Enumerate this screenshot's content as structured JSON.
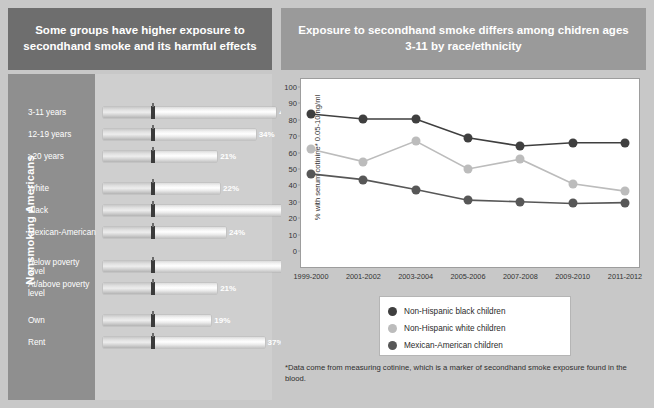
{
  "headers": {
    "left": "Some groups have higher exposure to secondhand smoke and its harmful effects",
    "right": "Exposure to secondhand smoke differs among chidren ages 3-11 by race/ethnicity"
  },
  "left_chart": {
    "axis_title": "Nonsmoking Americans",
    "type": "bar",
    "unit": "%",
    "max": 50,
    "items": [
      {
        "label": "3-11 years",
        "value": 41,
        "value_label": "41%"
      },
      {
        "label": "12-19 years",
        "value": 34,
        "value_label": "34%"
      },
      {
        "label": "≥20 years",
        "value": 21,
        "value_label": "21%"
      },
      {
        "label": "White",
        "value": 22,
        "value_label": "22%"
      },
      {
        "label": "Black",
        "value": 47,
        "value_label": "47%"
      },
      {
        "label": "Mexican-American",
        "value": 24,
        "value_label": "24%"
      },
      {
        "label": "Below poverty level",
        "value": 43,
        "value_label": "43%"
      },
      {
        "label": "At/above poverty level",
        "value": 21,
        "value_label": "21%"
      },
      {
        "label": "Own",
        "value": 19,
        "value_label": "19%"
      },
      {
        "label": "Rent",
        "value": 37,
        "value_label": "37%"
      }
    ]
  },
  "chart_data": {
    "type": "line",
    "title": "Exposure to secondhand smoke differs among chidren ages 3-11 by race/ethnicity",
    "xlabel": "",
    "ylabel": "% with serum cotinine* 0.05-10 ng/ml",
    "ylim": [
      0,
      100
    ],
    "ytick_step": 10,
    "yticks": [
      0,
      10,
      20,
      30,
      40,
      50,
      60,
      70,
      80,
      90,
      100
    ],
    "grid": false,
    "legend_position": "below-plot",
    "categories": [
      "1999-2000",
      "2001-2002",
      "2003-2004",
      "2005-2006",
      "2007-2008",
      "2009-2010",
      "2011-2012"
    ],
    "series": [
      {
        "name": "Non-Hispanic black children",
        "color": "#3f3f3f",
        "values": [
          83.5,
          80.5,
          80.5,
          69,
          64,
          66,
          66
        ]
      },
      {
        "name": "Non-Hispanic white children",
        "color": "#bcbcbc",
        "values": [
          62,
          54.5,
          67,
          50,
          56,
          41,
          36.5
        ]
      },
      {
        "name": "Mexican-American children",
        "color": "#575757",
        "values": [
          47,
          43.5,
          37.5,
          31,
          30,
          29,
          29.5
        ]
      }
    ]
  },
  "footnote": "*Data come from measuring cotinine, which is a marker of secondhand smoke exposure found in the blood.",
  "colors": {
    "header_left_bg": "#6e6e6e",
    "header_right_bg": "#9a9a9a",
    "panel_bg": "#c8c8c8",
    "left_band_bg": "#8f8f8f",
    "plot_bg": "#ffffff"
  }
}
